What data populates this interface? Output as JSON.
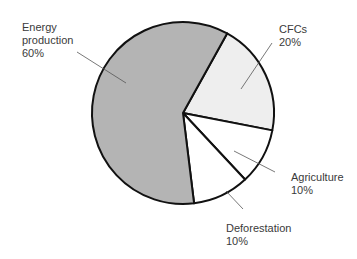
{
  "chart_data": {
    "type": "pie",
    "title": "",
    "categories": [
      "Energy production",
      "CFCs",
      "Agriculture",
      "Deforestation"
    ],
    "values": [
      60,
      20,
      10,
      10
    ],
    "unit": "%",
    "colors": [
      "#b4b4b4",
      "#eeeeee",
      "#ffffff",
      "#ffffff"
    ],
    "legend": "none (leader-line labels)",
    "labels": [
      {
        "name": "Energy production",
        "value": "60%",
        "line1": "Energy",
        "line2": "production",
        "line3": "60%"
      },
      {
        "name": "CFCs",
        "value": "20%",
        "line1": "CFCs",
        "line2": "20%"
      },
      {
        "name": "Agriculture",
        "value": "10%",
        "line1": "Agriculture",
        "line2": "10%"
      },
      {
        "name": "Deforestation",
        "value": "10%",
        "line1": "Deforestation",
        "line2": "10%"
      }
    ]
  },
  "style": {
    "outline_color": "#111111",
    "leader_color": "#555555"
  }
}
